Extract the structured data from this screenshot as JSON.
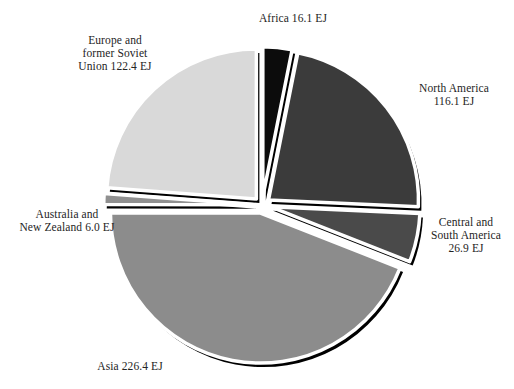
{
  "chart_data": {
    "type": "pie",
    "title": "",
    "unit": "EJ",
    "total": 513.9,
    "legend_position": "none",
    "labels_position": "outside",
    "categories": [
      "Africa",
      "North America",
      "Central and South America",
      "Asia",
      "Australia and New Zealand",
      "Europe and former Soviet Union"
    ],
    "values": [
      16.1,
      116.1,
      26.9,
      226.4,
      6.0,
      122.4
    ],
    "slices": [
      {
        "key": "africa",
        "name": "Africa",
        "value": 16.1,
        "label_text": "Africa 16.1 EJ",
        "color": "#0c0c0c",
        "start_angle": 0,
        "end_angle": 11.28,
        "explode": 0.055
      },
      {
        "key": "north-america",
        "name": "North America",
        "value": 116.1,
        "label_text": "North America\n116.1 EJ",
        "color": "#3b3b3b",
        "start_angle": 11.28,
        "end_angle": 92.62,
        "explode": 0.055
      },
      {
        "key": "central-south-america",
        "name": "Central and South America",
        "value": 26.9,
        "label_text": "Central and\nSouth America\n26.9 EJ",
        "color": "#4a4a4a",
        "start_angle": 92.62,
        "end_angle": 111.47,
        "explode": 0.055
      },
      {
        "key": "asia",
        "name": "Asia",
        "value": 226.4,
        "label_text": "Asia 226.4 EJ",
        "color": "#8c8c8c",
        "start_angle": 111.47,
        "end_angle": 270.05,
        "explode": 0.055
      },
      {
        "key": "australia-new-zealand",
        "name": "Australia and New Zealand",
        "value": 6.0,
        "label_text": "Australia and\nNew Zealand 6.0 EJ",
        "color": "#909090",
        "start_angle": 270.05,
        "end_angle": 274.25,
        "explode": 0.055
      },
      {
        "key": "europe-former-soviet-union",
        "name": "Europe and former Soviet Union",
        "value": 122.4,
        "label_text": "Europe and\nformer Soviet\nUnion 122.4 EJ",
        "color": "#d9d9d9",
        "start_angle": 274.25,
        "end_angle": 360,
        "explode": 0.055
      }
    ],
    "geometry": {
      "center_x": 262,
      "center_y": 205,
      "radius": 150,
      "shadow_offset_x": 3,
      "shadow_offset_y": 4,
      "gap_stroke_width": 3.5
    },
    "colors": {
      "background": "#ffffff",
      "text": "#242424",
      "outline": "#000000"
    }
  },
  "top_partial_text": ""
}
